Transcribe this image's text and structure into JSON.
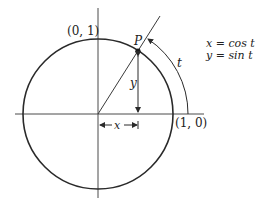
{
  "diagram": {
    "labels": {
      "top_point": "(0, 1)",
      "right_point": "(1, 0)",
      "point": "P",
      "arc": "t",
      "vertical_leg": "y",
      "horizontal_leg": "x"
    },
    "equations": {
      "line1": "x = cos t",
      "line2": "y = sin t"
    },
    "colors": {
      "stroke": "#2a2a2a",
      "axis": "#4a4a4a",
      "background": "#ffffff"
    }
  }
}
